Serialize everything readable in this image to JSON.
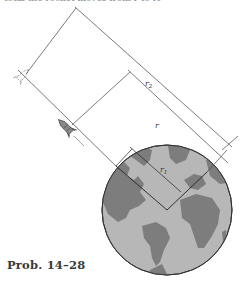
{
  "figure": {
    "caption": "Prob. 14–28",
    "top_text_cut": "total the rocket moves from r to r₂",
    "labels": {
      "r2": "r",
      "r2_sub": "2",
      "r": "r",
      "r1": "r",
      "r1_sub": "1"
    },
    "colors": {
      "globe_fill": "#b4b4b4",
      "land": "#7c7c7c",
      "line": "#444444",
      "background": "#ffffff"
    },
    "elements": [
      "earth-globe",
      "rocket-current",
      "rocket-ghost-dashed",
      "dimension-r1",
      "dimension-r",
      "dimension-r2"
    ]
  }
}
